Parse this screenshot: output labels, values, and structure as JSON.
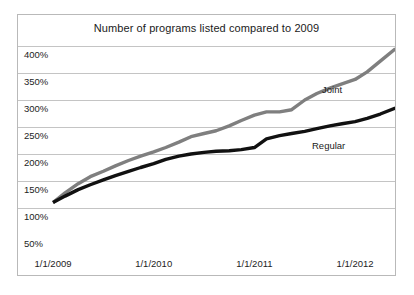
{
  "chart_data": {
    "type": "line",
    "title": "Number of programs listed compared to 2009",
    "xlabel": "",
    "ylabel": "",
    "grid": true,
    "legend_position": "inline-annotations",
    "xlim": [
      "1/1/2009",
      "1/1/2012"
    ],
    "ylim": [
      0,
      400
    ],
    "ytick_labels": [
      "400%",
      "350%",
      "300%",
      "250%",
      "200%",
      "150%",
      "100%",
      "50%"
    ],
    "ytick_values": [
      400,
      350,
      300,
      250,
      200,
      150,
      100,
      50
    ],
    "xtick_labels": [
      "1/1/2009",
      "1/1/2010",
      "1/1/2011",
      "1/1/2012"
    ],
    "xtick_values": [
      2009.0,
      2010.0,
      2011.0,
      2012.0
    ],
    "series": [
      {
        "name": "Joint",
        "color": "#7f7f7f",
        "x": [
          2009.0,
          2009.12,
          2009.25,
          2009.37,
          2009.5,
          2009.62,
          2009.75,
          2009.87,
          2010.0,
          2010.12,
          2010.25,
          2010.37,
          2010.5,
          2010.62,
          2010.75,
          2010.87,
          2011.0,
          2011.12,
          2011.25,
          2011.37,
          2011.5,
          2011.62,
          2011.75,
          2011.87,
          2012.0,
          2012.12,
          2012.25,
          2012.4
        ],
        "values": [
          110,
          128,
          145,
          158,
          168,
          178,
          188,
          196,
          204,
          212,
          222,
          232,
          238,
          243,
          252,
          262,
          272,
          278,
          278,
          282,
          300,
          312,
          322,
          330,
          338,
          352,
          372,
          395
        ]
      },
      {
        "name": "Regular",
        "color": "#111111",
        "x": [
          2009.0,
          2009.12,
          2009.25,
          2009.37,
          2009.5,
          2009.62,
          2009.75,
          2009.87,
          2010.0,
          2010.12,
          2010.25,
          2010.37,
          2010.5,
          2010.62,
          2010.75,
          2010.87,
          2011.0,
          2011.12,
          2011.25,
          2011.37,
          2011.5,
          2011.62,
          2011.75,
          2011.87,
          2012.0,
          2012.12,
          2012.25,
          2012.4
        ],
        "values": [
          110,
          122,
          134,
          143,
          152,
          160,
          168,
          175,
          182,
          190,
          196,
          200,
          203,
          205,
          206,
          208,
          212,
          228,
          234,
          238,
          242,
          247,
          252,
          256,
          260,
          266,
          274,
          285
        ]
      }
    ]
  },
  "annotations": {
    "joint_label": "Joint",
    "regular_label": "Regular"
  }
}
